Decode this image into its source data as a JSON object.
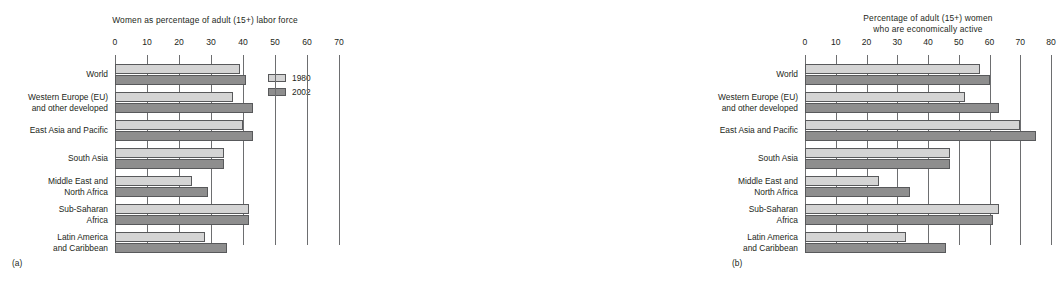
{
  "figure": {
    "captions": [
      {
        "id": "caption-a",
        "text": "(a)"
      },
      {
        "id": "caption-b",
        "text": "(b)"
      }
    ]
  },
  "legend": {
    "position": "inside-top-right-of-panel-a",
    "entries": [
      {
        "label": "1980",
        "color": "#d4d4d4"
      },
      {
        "label": "2002",
        "color": "#8e8e8e"
      }
    ]
  },
  "categories": [
    "World",
    "Western Europe (EU) and other developed",
    "East Asia and Pacific",
    "South Asia",
    "Middle East and North Africa",
    "Sub-Saharan Africa",
    "Latin America and Caribbean"
  ],
  "category_lines": [
    [
      "World"
    ],
    [
      "Western Europe (EU)",
      "and other developed"
    ],
    [
      "East Asia and Pacific"
    ],
    [
      "South Asia"
    ],
    [
      "Middle East and",
      "North Africa"
    ],
    [
      "Sub-Saharan",
      "Africa"
    ],
    [
      "Latin America",
      "and Caribbean"
    ]
  ],
  "chart_data": [
    {
      "id": "panel-a",
      "type": "bar",
      "orientation": "horizontal",
      "title": "Women as percentage of adult (15+) labor force",
      "title_lines": [
        "Women as percentage of adult (15+) labor force"
      ],
      "xlabel": "",
      "ylabel": "",
      "xlim": [
        0,
        70
      ],
      "xticks": [
        0,
        10,
        20,
        30,
        40,
        50,
        60,
        70
      ],
      "xtick_labels": [
        "0",
        "10",
        "20",
        "30",
        "40",
        "50",
        "60",
        "70"
      ],
      "grid": true,
      "legend": [
        "1980",
        "2002"
      ],
      "categories": [
        "World",
        "Western Europe (EU) and other developed",
        "East Asia and Pacific",
        "South Asia",
        "Middle East and North Africa",
        "Sub-Saharan Africa",
        "Latin America and Caribbean"
      ],
      "series": [
        {
          "name": "1980",
          "color": "#d4d4d4",
          "values": [
            39,
            37,
            40,
            34,
            24,
            42,
            28
          ]
        },
        {
          "name": "2002",
          "color": "#8e8e8e",
          "values": [
            41,
            43,
            43,
            34,
            29,
            42,
            35
          ]
        }
      ]
    },
    {
      "id": "panel-b",
      "type": "bar",
      "orientation": "horizontal",
      "title": "Percentage of adult (15+) women who are economically active",
      "title_lines": [
        "Percentage of adult (15+) women",
        "who are economically active"
      ],
      "xlabel": "",
      "ylabel": "",
      "xlim": [
        0,
        80
      ],
      "xticks": [
        0,
        10,
        20,
        30,
        40,
        50,
        60,
        70,
        80
      ],
      "xtick_labels": [
        "0",
        "10",
        "20",
        "30",
        "40",
        "50",
        "60",
        "70",
        "80"
      ],
      "grid": true,
      "legend": [
        "1980",
        "2002"
      ],
      "categories": [
        "World",
        "Western Europe (EU) and other developed",
        "East Asia and Pacific",
        "South Asia",
        "Middle East and North Africa",
        "Sub-Saharan Africa",
        "Latin America and Caribbean"
      ],
      "series": [
        {
          "name": "1980",
          "color": "#d4d4d4",
          "values": [
            57,
            52,
            70,
            47,
            24,
            63,
            33
          ]
        },
        {
          "name": "2002",
          "color": "#8e8e8e",
          "values": [
            60,
            63,
            75,
            47,
            34,
            61,
            46
          ]
        }
      ]
    }
  ]
}
